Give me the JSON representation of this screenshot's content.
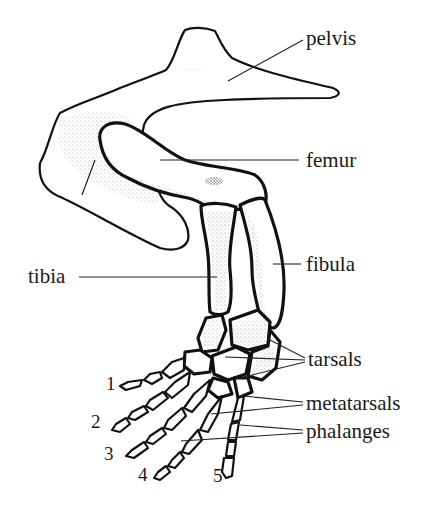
{
  "figure": {
    "labels": {
      "pelvis": "pelvis",
      "femur": "femur",
      "tibia": "tibia",
      "fibula": "fibula",
      "tarsals": "tarsals",
      "metatarsals": "metatarsals",
      "phalanges": "phalanges"
    },
    "digits": [
      "1",
      "2",
      "3",
      "4",
      "5"
    ],
    "colors": {
      "ink": "#111111",
      "background": "#ffffff"
    }
  }
}
